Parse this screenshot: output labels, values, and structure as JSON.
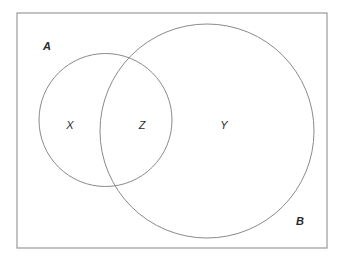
{
  "figure": {
    "type": "venn-diagram",
    "width": 342,
    "height": 261,
    "background_color": "#ffffff",
    "stroke_color": "#8a8a8a",
    "text_color": "#2b2b2b"
  },
  "universe": {
    "name": "universal-set-rectangle",
    "x": 17,
    "y": 13,
    "width": 310,
    "height": 235,
    "stroke_color": "#9a9a9a"
  },
  "sets": [
    {
      "id": "A",
      "label": "A",
      "label_x": 47,
      "label_y": 47,
      "cx": 105.5,
      "cy": 120,
      "r": 66.5
    },
    {
      "id": "B",
      "label": "B",
      "label_x": 300,
      "label_y": 222,
      "cx": 207,
      "cy": 131,
      "r": 107
    }
  ],
  "regions": [
    {
      "id": "X",
      "label": "X",
      "meaning": "A only",
      "x": 70,
      "y": 126
    },
    {
      "id": "Z",
      "label": "Z",
      "meaning": "A intersect B",
      "x": 142,
      "y": 126
    },
    {
      "id": "Y",
      "label": "Y",
      "meaning": "B only",
      "x": 224,
      "y": 126
    }
  ]
}
